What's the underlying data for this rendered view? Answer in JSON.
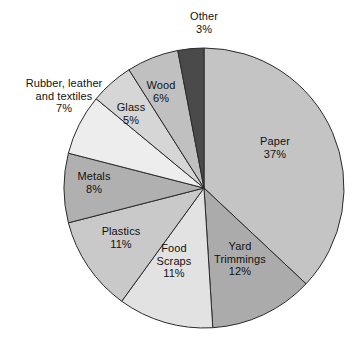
{
  "chart_data": {
    "type": "pie",
    "title": "",
    "subtitle": "",
    "xlabel": "",
    "ylabel": "",
    "grid": false,
    "legend_position": "none",
    "labels_position": "on-slice-and-outside",
    "start_angle_deg": 0,
    "direction": "clockwise",
    "value_unit": "%",
    "categories": [
      "Paper",
      "Yard Trimmings",
      "Food Scraps",
      "Plastics",
      "Metals",
      "Rubber, leather and textiles",
      "Glass",
      "Wood",
      "Other"
    ],
    "values": [
      37,
      12,
      11,
      11,
      8,
      7,
      5,
      6,
      3
    ],
    "slices": [
      {
        "name": "Paper",
        "value": 37,
        "label": "Paper",
        "pct_text": "37%",
        "color": "#c4c4c4"
      },
      {
        "name": "Yard Trimmings",
        "value": 12,
        "label": "Yard Trimmings",
        "pct_text": "12%",
        "color": "#ababab"
      },
      {
        "name": "Food Scraps",
        "value": 11,
        "label": "Food Scraps",
        "pct_text": "11%",
        "color": "#e2e2e2"
      },
      {
        "name": "Plastics",
        "value": 11,
        "label": "Plastics",
        "pct_text": "11%",
        "color": "#c9c9c9"
      },
      {
        "name": "Metals",
        "value": 8,
        "label": "Metals",
        "pct_text": "8%",
        "color": "#b0b0b0"
      },
      {
        "name": "Rubber, leather and textiles",
        "value": 7,
        "label": "Rubber, leather and textiles",
        "pct_text": "7%",
        "color": "#ededed"
      },
      {
        "name": "Glass",
        "value": 5,
        "label": "Glass",
        "pct_text": "5%",
        "color": "#d6d6d6"
      },
      {
        "name": "Wood",
        "value": 6,
        "label": "Wood",
        "pct_text": "6%",
        "color": "#c0c0c0"
      },
      {
        "name": "Other",
        "value": 3,
        "label": "Other",
        "pct_text": "3%",
        "color": "#4a4a4a"
      }
    ]
  },
  "labels": {
    "other": {
      "name": "Other",
      "pct": "3%"
    },
    "wood": {
      "name": "Wood",
      "pct": "6%"
    },
    "glass": {
      "name": "Glass",
      "pct": "5%"
    },
    "rubber": {
      "line1": "Rubber, leather",
      "line2": "and textiles",
      "pct": "7%"
    },
    "metals": {
      "name": "Metals",
      "pct": "8%"
    },
    "plastics": {
      "name": "Plastics",
      "pct": "11%"
    },
    "food": {
      "line1": "Food",
      "line2": "Scraps",
      "pct": "11%"
    },
    "yard": {
      "line1": "Yard",
      "line2": "Trimmings",
      "pct": "12%"
    },
    "paper": {
      "name": "Paper",
      "pct": "37%"
    }
  },
  "style": {
    "background": "#ffffff",
    "stroke": "#2b2b2b",
    "text": "#111111"
  }
}
